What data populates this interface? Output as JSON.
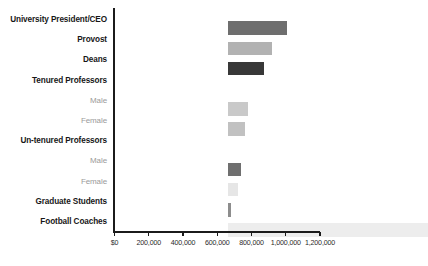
{
  "chart_data": {
    "type": "bar",
    "orientation": "horizontal",
    "title": "",
    "subtitle": "",
    "xlabel": "",
    "ylabel": "",
    "grid": false,
    "legend": null,
    "xlim": [
      0,
      1200000
    ],
    "categories": [
      "University President/CEO",
      "Provost",
      "Deans",
      "Tenured Professors",
      "Male",
      "Female",
      "Un-tenured Professors",
      "Male",
      "Female",
      "Graduate Students",
      "Football Coaches"
    ],
    "values": [
      350000,
      260000,
      215000,
      null,
      120000,
      105000,
      null,
      80000,
      62000,
      20000,
      1170000
    ],
    "tick_values": [
      0,
      200000,
      400000,
      600000,
      800000,
      1000000,
      1200000
    ],
    "tick_labels": [
      "$0",
      "200,000",
      "400,000",
      "600,000",
      "800,000",
      "1,000,000",
      "1,200,000"
    ],
    "bars": [
      {
        "label": "University President/CEO",
        "sublabel": false,
        "header_only": false,
        "value": 350000,
        "color": "#6e6e6e"
      },
      {
        "label": "Provost",
        "sublabel": false,
        "header_only": false,
        "value": 260000,
        "color": "#b2b2b2"
      },
      {
        "label": "Deans",
        "sublabel": false,
        "header_only": false,
        "value": 215000,
        "color": "#383838"
      },
      {
        "label": "Tenured Professors",
        "sublabel": false,
        "header_only": true,
        "value": null,
        "color": "transparent"
      },
      {
        "label": "Male",
        "sublabel": true,
        "header_only": false,
        "value": 120000,
        "color": "#c9c9c9"
      },
      {
        "label": "Female",
        "sublabel": true,
        "header_only": false,
        "value": 105000,
        "color": "#c1c1c1"
      },
      {
        "label": "Un-tenured Professors",
        "sublabel": false,
        "header_only": true,
        "value": null,
        "color": "transparent"
      },
      {
        "label": "Male",
        "sublabel": true,
        "header_only": false,
        "value": 80000,
        "color": "#6f6f6f"
      },
      {
        "label": "Female",
        "sublabel": true,
        "header_only": false,
        "value": 62000,
        "color": "#e6e6e6"
      },
      {
        "label": "Graduate Students",
        "sublabel": false,
        "header_only": false,
        "value": 20000,
        "color": "#8d8d8d"
      },
      {
        "label": "Football Coaches",
        "sublabel": false,
        "header_only": false,
        "value": 1170000,
        "color": "#ededed"
      }
    ],
    "colors": {
      "axis": "#1b1b1b",
      "label": "#171717",
      "sublabel": "#9a9a9a",
      "tick_label": "#2b2b2b",
      "background": "#ffffff"
    }
  }
}
